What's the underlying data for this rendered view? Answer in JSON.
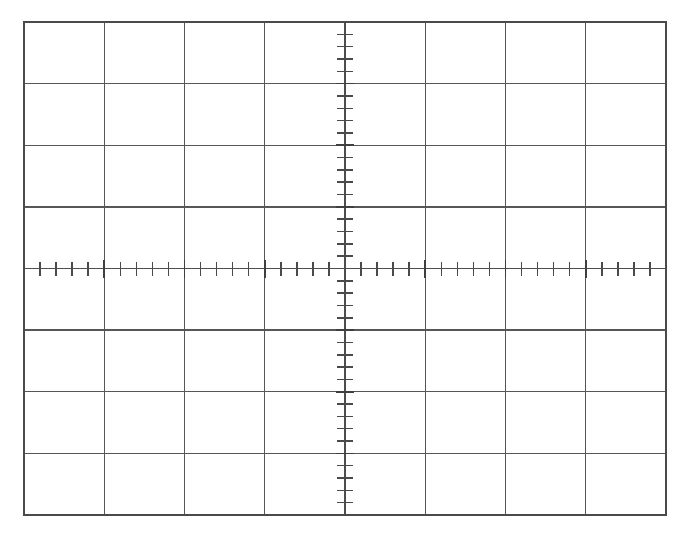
{
  "page": {
    "background_color": "#ffffff",
    "width": 677,
    "height": 540
  },
  "graticule": {
    "name": "oscilloscope-graticule",
    "description": "8 x 8 division CRT oscilloscope graticule with centered horizontal and vertical axes bearing minor tick subdivisions",
    "divisions_horizontal": 8,
    "divisions_vertical": 8,
    "minor_ticks_per_division": 5,
    "grid_color": "#575757",
    "border_color": "#4a4a4a",
    "axis_color": "#4d4d4d",
    "tick_color": "#4a4a4a",
    "background_color": "#ffffff",
    "geometry": {
      "left": 24,
      "top": 22,
      "right": 666,
      "bottom": 515,
      "cell_width": 80.25,
      "cell_height": 61.625,
      "center_x": 345,
      "center_y": 268.5
    },
    "ticks": {
      "horizontal_axis_tick_half_length": 7,
      "vertical_axis_tick_half_length": 8,
      "major_tick_half_length": 9
    },
    "vertical_grid_x": [
      24,
      104.25,
      184.5,
      264.75,
      345,
      425.25,
      505.5,
      585.75,
      666
    ],
    "horizontal_grid_y": [
      22,
      83.625,
      145.25,
      206.875,
      268.5,
      330.125,
      391.75,
      453.375,
      515
    ]
  }
}
